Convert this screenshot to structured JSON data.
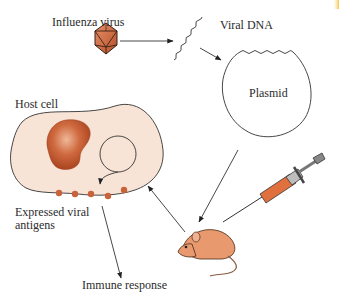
{
  "diagram": {
    "labels": {
      "influenza_virus": "Influenza virus",
      "viral_dna": "Viral DNA",
      "plasmid": "Plasmid",
      "host_cell": "Host cell",
      "expressed_viral_antigens": "Expressed viral antigens",
      "immune_response": "Immune response"
    },
    "flow": [
      {
        "from": "Influenza virus",
        "to": "Viral DNA"
      },
      {
        "from": "Viral DNA",
        "to": "Plasmid"
      },
      {
        "from": "Plasmid",
        "to": "Mouse (injection)"
      },
      {
        "from": "Mouse",
        "to": "Host cell"
      },
      {
        "from": "Host cell",
        "to": "Expressed viral antigens"
      },
      {
        "from": "Expressed viral antigens",
        "to": "Immune response"
      }
    ],
    "icons": [
      "virus-icosahedron-icon",
      "viral-dna-strand-icon",
      "plasmid-icon",
      "host-cell-icon",
      "nucleus-icon",
      "syringe-icon",
      "mouse-icon"
    ],
    "colors": {
      "virus": "#c8643c",
      "cell_fill": "#f8e4d6",
      "nucleus": "#c2522a",
      "antigen": "#c8623a",
      "mouse": "#e89a6e",
      "syringe_liquid": "#e0703e",
      "line": "#333333"
    }
  }
}
